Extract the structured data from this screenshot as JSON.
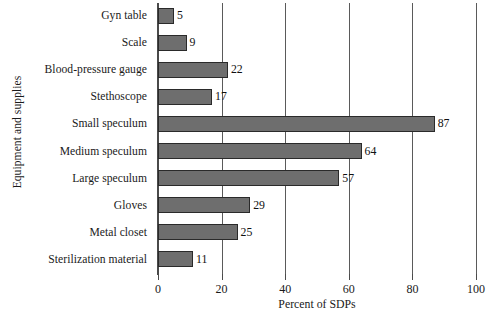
{
  "chart_data": {
    "type": "bar",
    "orientation": "horizontal",
    "title": "",
    "xlabel": "Percent of SDPs",
    "ylabel": "Equipment and supplies",
    "xlim": [
      0,
      100
    ],
    "xticks": [
      0,
      20,
      40,
      60,
      80,
      100
    ],
    "grid": true,
    "legend": false,
    "bar_color": "#6e6e6e",
    "bar_edge_color": "#2a2a2a",
    "show_value_labels": true,
    "categories": [
      "Gyn table",
      "Scale",
      "Blood-pressure gauge",
      "Stethoscope",
      "Small speculum",
      "Medium speculum",
      "Large speculum",
      "Gloves",
      "Metal closet",
      "Sterilization material"
    ],
    "values": [
      5,
      9,
      22,
      17,
      87,
      64,
      57,
      29,
      25,
      11
    ],
    "value_labels": [
      "5",
      "9",
      "22",
      "17",
      "87",
      "64",
      "57",
      "29",
      "25",
      "11"
    ],
    "xtick_labels": [
      "0",
      "20",
      "40",
      "60",
      "80",
      "100"
    ]
  }
}
